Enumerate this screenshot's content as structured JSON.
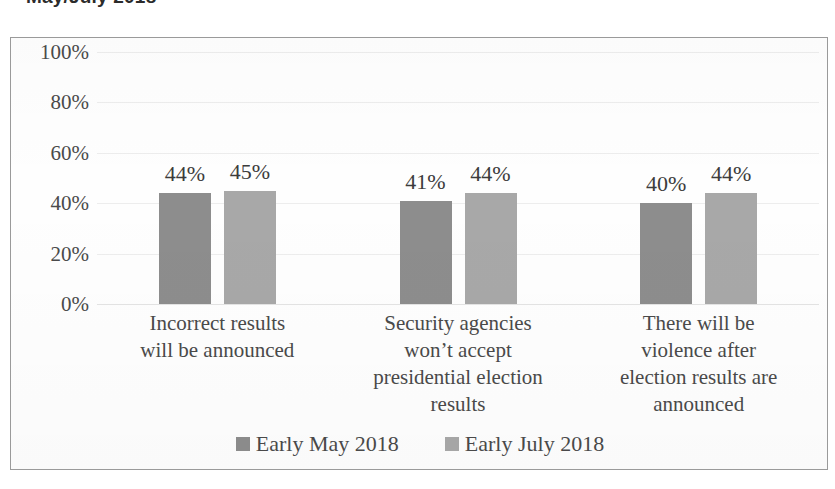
{
  "chart_data": {
    "type": "bar",
    "title": "May/July 2018",
    "xlabel": "",
    "ylabel": "",
    "ylim": [
      0,
      100
    ],
    "grid": true,
    "legend_position": "bottom",
    "categories": [
      "Incorrect results will be announced",
      "Security agencies won’t accept presidential election results",
      "There will be violence after election results are announced"
    ],
    "category_lines": [
      [
        "Incorrect results",
        "will be announced"
      ],
      [
        "Security agencies",
        "won’t accept",
        "presidential election",
        "results"
      ],
      [
        "There will be",
        "violence after",
        "election results are",
        "announced"
      ]
    ],
    "series": [
      {
        "name": "Early May 2018",
        "color": "#8d8d8d",
        "values": [
          44,
          41,
          40
        ],
        "labels": [
          "44%",
          "41%",
          "40%"
        ]
      },
      {
        "name": "Early July 2018",
        "color": "#a8a8a8",
        "values": [
          45,
          44,
          44
        ],
        "labels": [
          "45%",
          "44%",
          "44%"
        ]
      }
    ],
    "yticks": [
      100,
      80,
      60,
      40,
      20,
      0
    ],
    "ytick_labels": [
      "100%",
      "80%",
      "60%",
      "40%",
      "20%",
      "0%"
    ]
  },
  "legend": {
    "items": [
      {
        "label": "Early May 2018",
        "color": "#8d8d8d"
      },
      {
        "label": "Early July 2018",
        "color": "#a8a8a8"
      }
    ]
  }
}
